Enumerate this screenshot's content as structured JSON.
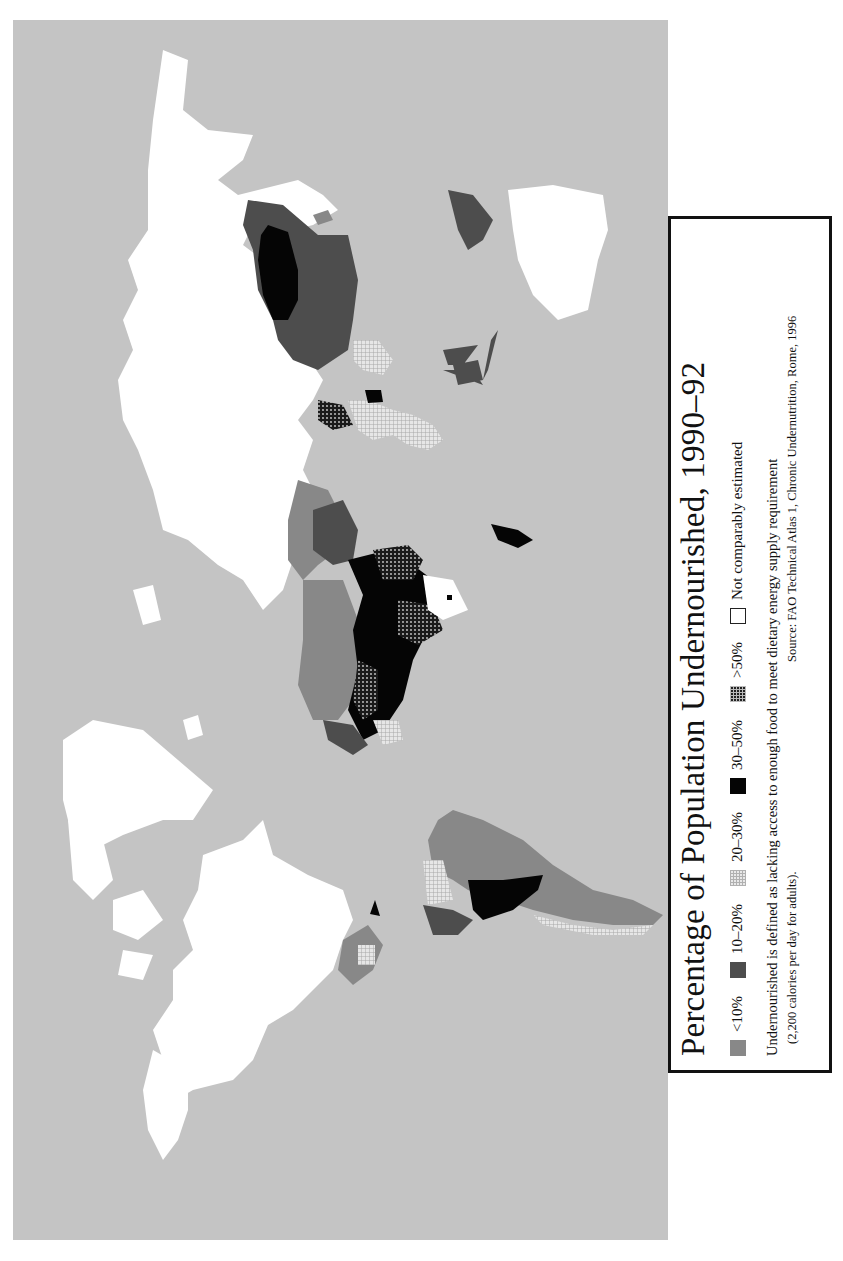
{
  "legend": {
    "title": "Percentage of Population Undernourished, 1990–92",
    "categories": [
      {
        "label": "<10%",
        "swatch": "solid-medium-gray",
        "color": "#888888"
      },
      {
        "label": "10–20%",
        "swatch": "solid-dark-gray",
        "color": "#4d4d4d"
      },
      {
        "label": "20–30%",
        "swatch": "light-grid-hatch",
        "color": "#e8e8e8"
      },
      {
        "label": "30–50%",
        "swatch": "solid-black",
        "color": "#050505"
      },
      {
        "label": ">50%",
        "swatch": "dark-grid-hatch",
        "color": "#222222"
      },
      {
        "label": "Not comparably estimated",
        "swatch": "white-outline",
        "color": "#ffffff"
      }
    ],
    "note": "Undernourished is defined as lacking access to enough food to meet dietary energy supply requirement",
    "note_sub": "(2,200 calories per day for adults).",
    "source": "Source: FAO Technical Atlas 1, Chronic Undernutrition, Rome, 1996"
  },
  "map": {
    "orientation": "rotated 90° counter-clockwise (north points left)",
    "ocean_color": "#c4c4c4",
    "regions": [
      {
        "name": "North America",
        "category": "Not comparably estimated"
      },
      {
        "name": "Greenland",
        "category": "Not comparably estimated"
      },
      {
        "name": "Europe / Russia",
        "category": "Not comparably estimated"
      },
      {
        "name": "Australia",
        "category": "Not comparably estimated"
      },
      {
        "name": "China",
        "category": "10–20%"
      },
      {
        "name": "Mongolia",
        "category": "30–50%"
      },
      {
        "name": "India",
        "category": "20–30%"
      },
      {
        "name": "Southeast Asia / Indonesia",
        "category": "10–20%"
      },
      {
        "name": "North Africa",
        "category": "<10%"
      },
      {
        "name": "Sub-Saharan Africa",
        "category": "30–50% / >50%"
      },
      {
        "name": "South Africa",
        "category": "Not comparably estimated"
      },
      {
        "name": "Madagascar",
        "category": "30–50%"
      },
      {
        "name": "Middle East",
        "category": "<10% / 10–20%"
      },
      {
        "name": "South America",
        "category": "<10% / 10–20% / 30–50%"
      },
      {
        "name": "Central America",
        "category": "<10% / 20–30%"
      }
    ]
  }
}
